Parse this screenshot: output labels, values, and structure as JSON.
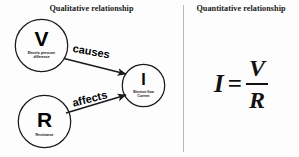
{
  "panels": {
    "qualitative": {
      "title": "Qualitative relationship"
    },
    "quantitative": {
      "title": "Quantitative relationship"
    }
  },
  "diagram": {
    "type": "concept-map",
    "nodes": [
      {
        "id": "V",
        "symbol": "V",
        "caption": "Electric pressure\ndifference",
        "shape": "circle",
        "cx": 41.5,
        "cy": 45.5,
        "r": 26.5
      },
      {
        "id": "R",
        "symbol": "R",
        "caption": "Resistance",
        "shape": "circle",
        "cx": 44.5,
        "cy": 121.5,
        "r": 26.5
      },
      {
        "id": "I",
        "symbol": "I",
        "caption": "Electron flow\nCurrent",
        "shape": "circle",
        "cx": 143.5,
        "cy": 85.5,
        "r": 21.5
      }
    ],
    "edges": [
      {
        "from": "V",
        "to": "I",
        "label": "causes"
      },
      {
        "from": "R",
        "to": "I",
        "label": "affects"
      }
    ]
  },
  "equation": {
    "lhs": "I",
    "operator": "=",
    "numerator": "V",
    "denominator": "R",
    "plain": "I = V / R"
  },
  "colors": {
    "background": "#fdfdfd",
    "stroke": "#1a1a1a",
    "divider": "#b9b9b9",
    "text": "#111111"
  }
}
